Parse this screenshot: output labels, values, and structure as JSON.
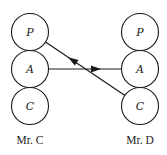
{
  "diagram": {
    "type": "transactional-analysis-crossed-transaction",
    "persons": [
      {
        "id": "mr-c",
        "label": "Mr. C",
        "ego_states": [
          {
            "key": "P",
            "label": "P"
          },
          {
            "key": "A",
            "label": "A"
          },
          {
            "key": "C",
            "label": "C"
          }
        ]
      },
      {
        "id": "mr-d",
        "label": "Mr. D",
        "ego_states": [
          {
            "key": "P",
            "label": "P"
          },
          {
            "key": "A",
            "label": "A"
          },
          {
            "key": "C",
            "label": "C"
          }
        ]
      }
    ],
    "transactions": [
      {
        "from": "Mr. C:A",
        "to": "Mr. D:A",
        "direction": "right"
      },
      {
        "from": "Mr. D:C",
        "to": "Mr. C:P",
        "direction": "up-left"
      }
    ],
    "colors": {
      "stroke": "#1a1a1a",
      "background": "#ffffff"
    }
  }
}
